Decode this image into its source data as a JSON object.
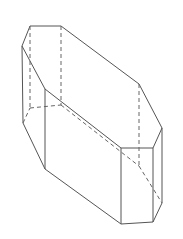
{
  "figure": {
    "stroke_color": "#555555",
    "background": "#ffffff",
    "solid_edges": [
      [
        30,
        26,
        61,
        26
      ],
      [
        30,
        26,
        22,
        46
      ],
      [
        22,
        46,
        45,
        89
      ],
      [
        61,
        26,
        139,
        84
      ],
      [
        139,
        84,
        162,
        128
      ],
      [
        45,
        89,
        121,
        148
      ],
      [
        121,
        148,
        153,
        148
      ],
      [
        153,
        148,
        162,
        128
      ],
      [
        22,
        46,
        23,
        123
      ],
      [
        45,
        89,
        45,
        169
      ],
      [
        121,
        148,
        121,
        224
      ],
      [
        153,
        148,
        153,
        222
      ],
      [
        162,
        128,
        162,
        203
      ],
      [
        23,
        123,
        45,
        169
      ],
      [
        45,
        169,
        121,
        224
      ],
      [
        121,
        224,
        153,
        222
      ],
      [
        153,
        222,
        162,
        203
      ]
    ],
    "hidden_edges": [
      [
        30,
        26,
        30,
        108
      ],
      [
        61,
        26,
        61,
        105
      ],
      [
        139,
        84,
        139,
        166
      ],
      [
        23,
        123,
        30,
        108
      ],
      [
        30,
        108,
        61,
        105
      ],
      [
        61,
        105,
        139,
        166
      ],
      [
        139,
        166,
        162,
        203
      ]
    ]
  }
}
